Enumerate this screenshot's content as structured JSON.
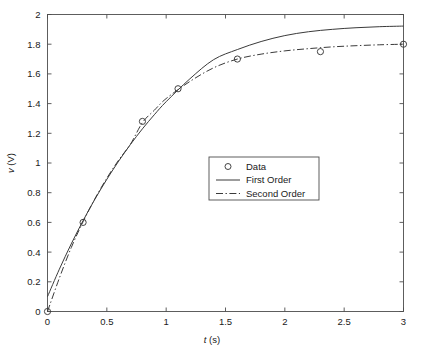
{
  "chart_data": {
    "type": "line",
    "title": "",
    "xlabel": "t (s)",
    "ylabel": "v (V)",
    "xlim": [
      0,
      3
    ],
    "ylim": [
      0,
      2
    ],
    "grid": false,
    "legend_position": "center",
    "xticks": [
      0,
      0.5,
      1,
      1.5,
      2,
      2.5,
      3
    ],
    "xticklabels": [
      "0",
      "0.5",
      "1",
      "1.5",
      "2",
      "2.5",
      "3"
    ],
    "yticks": [
      0,
      0.2,
      0.4,
      0.6,
      0.8,
      1,
      1.2,
      1.4,
      1.6,
      1.8,
      2
    ],
    "yticklabels": [
      "0",
      "0.2",
      "0.4",
      "0.6",
      "0.8",
      "1",
      "1.2",
      "1.4",
      "1.6",
      "1.8",
      "2"
    ],
    "series": [
      {
        "name": "Data",
        "style": "markers",
        "marker": "circle",
        "x": [
          0,
          0.3,
          0.8,
          1.1,
          1.6,
          2.3,
          3.0
        ],
        "y": [
          0.0,
          0.6,
          1.28,
          1.5,
          1.7,
          1.75,
          1.8
        ]
      },
      {
        "name": "First Order",
        "style": "solid",
        "x": [
          0,
          0.1,
          0.2,
          0.3,
          0.4,
          0.5,
          0.6,
          0.7,
          0.8,
          0.9,
          1.0,
          1.2,
          1.4,
          1.6,
          1.8,
          2.0,
          2.2,
          2.4,
          2.6,
          2.8,
          3.0
        ],
        "y": [
          0.1,
          0.285,
          0.455,
          0.612,
          0.757,
          0.89,
          1.013,
          1.126,
          1.23,
          1.325,
          1.413,
          1.567,
          1.696,
          1.764,
          1.818,
          1.858,
          1.884,
          1.9,
          1.911,
          1.918,
          1.922
        ]
      },
      {
        "name": "Second Order",
        "style": "dash-dot",
        "x": [
          0,
          0.1,
          0.2,
          0.3,
          0.4,
          0.5,
          0.6,
          0.7,
          0.8,
          0.9,
          1.0,
          1.2,
          1.4,
          1.6,
          1.8,
          2.0,
          2.2,
          2.4,
          2.6,
          2.8,
          3.0
        ],
        "y": [
          0.0,
          0.225,
          0.43,
          0.605,
          0.76,
          0.898,
          1.02,
          1.128,
          1.272,
          1.355,
          1.434,
          1.549,
          1.641,
          1.7,
          1.733,
          1.755,
          1.77,
          1.782,
          1.79,
          1.796,
          1.8
        ]
      }
    ],
    "legend": [
      {
        "label": "Data",
        "style": "markers",
        "marker": "circle"
      },
      {
        "label": "First Order",
        "style": "solid"
      },
      {
        "label": "Second Order",
        "style": "dash-dot"
      }
    ],
    "colors": {
      "axis": "#4d4d4d",
      "line": "#3a3a3a",
      "text": "#1a1a1a",
      "background": "#ffffff"
    }
  }
}
